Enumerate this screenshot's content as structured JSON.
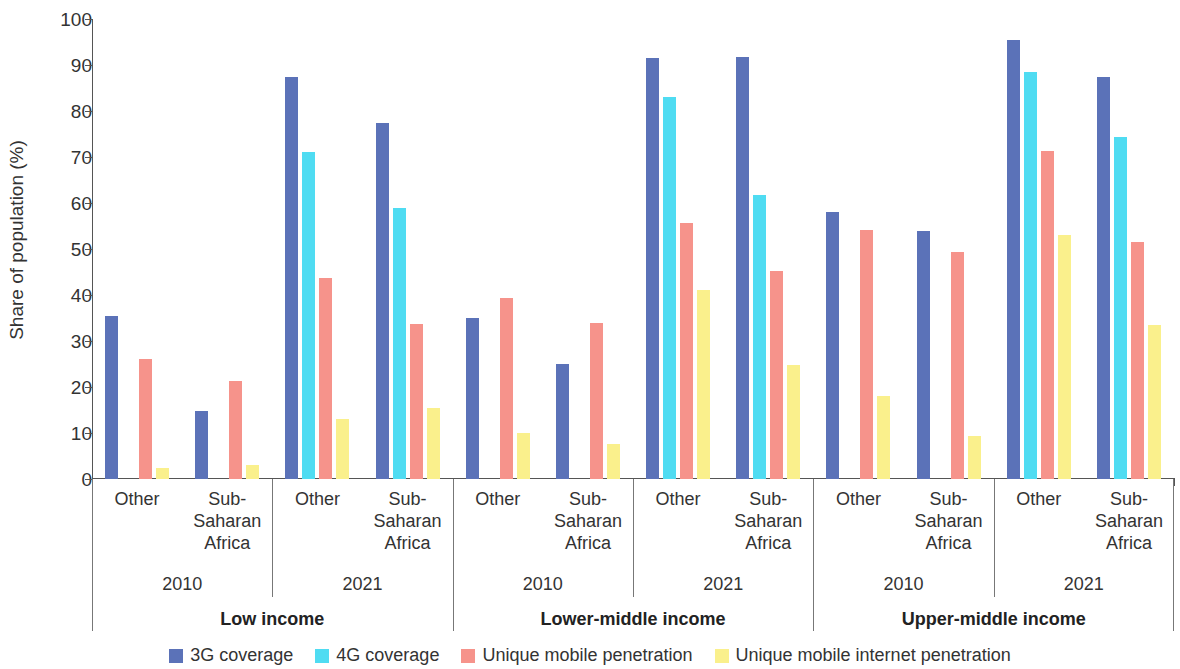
{
  "chart_data": {
    "type": "bar",
    "title": "",
    "xlabel": "",
    "ylabel": "Share of population (%)",
    "ylim": [
      0,
      100
    ],
    "yticks": [
      0,
      10,
      20,
      30,
      40,
      50,
      60,
      70,
      80,
      90,
      100
    ],
    "grid": false,
    "legend_position": "bottom",
    "series": [
      {
        "name": "3G coverage",
        "color": "#5B72B8",
        "values": [
          35.5,
          14.8,
          87.5,
          77.4,
          35.1,
          25.0,
          91.5,
          91.8,
          58.1,
          54.0,
          95.5,
          87.4
        ]
      },
      {
        "name": "4G coverage",
        "color": "#4FDCF2",
        "values": [
          0,
          0,
          71.0,
          59.0,
          0,
          0,
          83.0,
          61.7,
          0,
          0,
          88.4,
          74.4
        ]
      },
      {
        "name": "Unique mobile penetration",
        "color": "#F6938B",
        "values": [
          26.1,
          21.2,
          43.6,
          33.6,
          39.3,
          34.0,
          55.7,
          45.2,
          54.2,
          49.3,
          71.3,
          51.5
        ]
      },
      {
        "name": "Unique mobile internet penetration",
        "color": "#FAF08C",
        "values": [
          2.5,
          3.0,
          13.1,
          15.5,
          10.0,
          7.7,
          41.0,
          24.8,
          18.0,
          9.4,
          53.0,
          33.5
        ]
      }
    ],
    "groups": [
      {
        "region": "Other",
        "year": "2010",
        "income": "Low income"
      },
      {
        "region": "Sub-\nSaharan\nAfrica",
        "year": "2010",
        "income": "Low income"
      },
      {
        "region": "Other",
        "year": "2021",
        "income": "Low income"
      },
      {
        "region": "Sub-\nSaharan\nAfrica",
        "year": "2021",
        "income": "Low income"
      },
      {
        "region": "Other",
        "year": "2010",
        "income": "Lower-middle income"
      },
      {
        "region": "Sub-\nSaharan\nAfrica",
        "year": "2010",
        "income": "Lower-middle income"
      },
      {
        "region": "Other",
        "year": "2021",
        "income": "Lower-middle income"
      },
      {
        "region": "Sub-\nSaharan\nAfrica",
        "year": "2021",
        "income": "Lower-middle income"
      },
      {
        "region": "Other",
        "year": "2010",
        "income": "Upper-middle income"
      },
      {
        "region": "Sub-\nSaharan\nAfrica",
        "year": "2010",
        "income": "Upper-middle income"
      },
      {
        "region": "Other",
        "year": "2021",
        "income": "Upper-middle income"
      },
      {
        "region": "Sub-\nSaharan\nAfrica",
        "year": "2021",
        "income": "Upper-middle income"
      }
    ],
    "region_labels": [
      "Other",
      "Sub-\nSaharan\nAfrica"
    ],
    "year_labels": [
      "2010",
      "2021"
    ],
    "income_labels": [
      "Low income",
      "Lower-middle income",
      "Upper-middle income"
    ],
    "tick_labels": [
      "0",
      "10",
      "20",
      "30",
      "40",
      "50",
      "60",
      "70",
      "80",
      "90",
      "100"
    ]
  },
  "axis": {
    "y_title": "Share of population (%)"
  },
  "legend": {
    "items": [
      {
        "label": "3G coverage",
        "color": "#5B72B8"
      },
      {
        "label": "4G coverage",
        "color": "#4FDCF2"
      },
      {
        "label": "Unique mobile penetration",
        "color": "#F6938B"
      },
      {
        "label": "Unique mobile internet penetration",
        "color": "#FAF08C"
      }
    ]
  }
}
